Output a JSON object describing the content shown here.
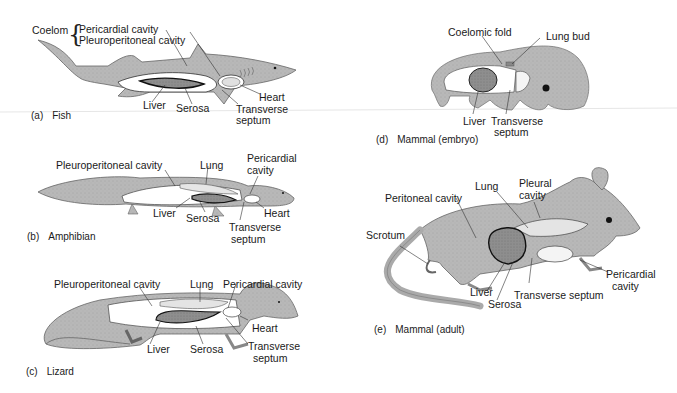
{
  "figure": {
    "panels": [
      {
        "id": "a",
        "caption_letter": "(a)",
        "caption_title": "Fish",
        "labels": {
          "coelom": "Coelom",
          "pericardial_cavity": "Pericardial cavity",
          "pleuroperitoneal_cavity": "Pleuroperitoneal cavity",
          "heart": "Heart",
          "liver": "Liver",
          "serosa": "Serosa",
          "transverse_septum_1": "Transverse",
          "transverse_septum_2": "septum"
        }
      },
      {
        "id": "b",
        "caption_letter": "(b)",
        "caption_title": "Amphibian",
        "labels": {
          "pleuroperitoneal_cavity": "Pleuroperitoneal cavity",
          "lung": "Lung",
          "pericardial_cavity_1": "Pericardial",
          "pericardial_cavity_2": "cavity",
          "liver": "Liver",
          "serosa": "Serosa",
          "heart": "Heart",
          "transverse_septum_1": "Transverse",
          "transverse_septum_2": "septum"
        }
      },
      {
        "id": "c",
        "caption_letter": "(c)",
        "caption_title": "Lizard",
        "labels": {
          "pleuroperitoneal_cavity": "Pleuroperitoneal cavity",
          "lung": "Lung",
          "pericardial_cavity": "Pericardial cavity",
          "heart": "Heart",
          "liver": "Liver",
          "serosa": "Serosa",
          "transverse_septum_1": "Transverse",
          "transverse_septum_2": "septum"
        }
      },
      {
        "id": "d",
        "caption_letter": "(d)",
        "caption_title": "Mammal (embryo)",
        "labels": {
          "coelomic_fold": "Coelomic fold",
          "lung_bud": "Lung bud",
          "liver": "Liver",
          "transverse_septum_1": "Transverse",
          "transverse_septum_2": "septum"
        }
      },
      {
        "id": "e",
        "caption_letter": "(e)",
        "caption_title": "Mammal (adult)",
        "labels": {
          "lung": "Lung",
          "pleural_cavity_1": "Pleural",
          "pleural_cavity_2": "cavity",
          "peritoneal_cavity": "Peritoneal cavity",
          "scrotum": "Scrotum",
          "pericardial_cavity_1": "Pericardial",
          "pericardial_cavity_2": "cavity",
          "liver": "Liver",
          "transverse_septum": "Transverse septum",
          "serosa": "Serosa"
        }
      }
    ],
    "colors": {
      "body": "#b9b9b9",
      "body_dark": "#9a9a9a",
      "liver": "#8c8c8c",
      "lung": "#e4e4e4",
      "cavity": "#ffffff",
      "outline": "#2a2a2a",
      "leader": "#333333"
    }
  }
}
